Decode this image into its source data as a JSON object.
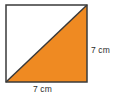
{
  "figure": {
    "name": "square-with-shaded-triangle",
    "background_color": "#ffffff",
    "square": {
      "name": "outer-square",
      "stroke_color": "#3a3a3a",
      "stroke_width": 1.5,
      "fill_color": "#ffffff",
      "x": 6,
      "y": 5,
      "width": 81,
      "height": 77
    },
    "shaded_triangle": {
      "name": "shaded-half-triangle",
      "fill_color": "#ef8a22",
      "stroke_color": "#3a3a3a",
      "stroke_width": 1.5,
      "vertices": "top-right, bottom-right, bottom-left",
      "points": "87,5 87,82 6,82"
    },
    "diagonal": {
      "name": "diagonal-line",
      "from": "bottom-left",
      "to": "top-right",
      "stroke_color": "#3a3a3a",
      "stroke_width": 1.5
    }
  },
  "labels": {
    "right_side": {
      "text": "7 cm",
      "value": 7,
      "unit": "cm",
      "position": "right"
    },
    "bottom_side": {
      "text": "7 cm",
      "value": 7,
      "unit": "cm",
      "position": "bottom"
    }
  },
  "colors": {
    "shade": "#ef8a22",
    "outline": "#3a3a3a",
    "text": "#2b2b2b",
    "background": "#ffffff"
  }
}
